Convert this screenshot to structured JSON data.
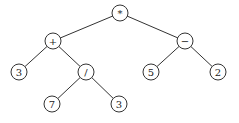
{
  "diagram": {
    "type": "expression-tree",
    "node_radius": 8,
    "nodes": [
      {
        "id": "n0",
        "label": "*",
        "x": 120,
        "y": 13
      },
      {
        "id": "n1",
        "label": "+",
        "x": 53,
        "y": 41
      },
      {
        "id": "n2",
        "label": "−",
        "x": 185,
        "y": 41
      },
      {
        "id": "n3",
        "label": "3",
        "x": 19,
        "y": 72
      },
      {
        "id": "n4",
        "label": "/",
        "x": 86,
        "y": 72
      },
      {
        "id": "n5",
        "label": "5",
        "x": 151,
        "y": 72
      },
      {
        "id": "n6",
        "label": "2",
        "x": 218,
        "y": 72
      },
      {
        "id": "n7",
        "label": "7",
        "x": 52,
        "y": 104
      },
      {
        "id": "n8",
        "label": "3",
        "x": 119,
        "y": 104
      }
    ],
    "edges": [
      {
        "from": "n0",
        "to": "n1"
      },
      {
        "from": "n0",
        "to": "n2"
      },
      {
        "from": "n1",
        "to": "n3"
      },
      {
        "from": "n1",
        "to": "n4"
      },
      {
        "from": "n2",
        "to": "n5"
      },
      {
        "from": "n2",
        "to": "n6"
      },
      {
        "from": "n4",
        "to": "n7"
      },
      {
        "from": "n4",
        "to": "n8"
      }
    ]
  }
}
